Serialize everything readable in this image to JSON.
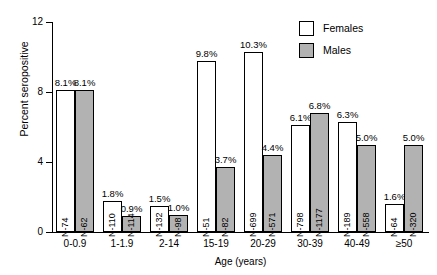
{
  "chart_data": {
    "type": "bar",
    "title": "",
    "xlabel": "Age (years)",
    "ylabel": "Percent seropositive",
    "ylim": [
      0,
      12
    ],
    "yticks": [
      0,
      4,
      8,
      12
    ],
    "ytick_labels": [
      "0",
      "4",
      "8",
      "12"
    ],
    "grid": false,
    "legend_position": "top-right",
    "categories": [
      "0-0.9",
      "1-1.9",
      "2-14",
      "15-19",
      "20-29",
      "30-39",
      "40-49",
      "≥50"
    ],
    "series": [
      {
        "name": "Females",
        "color": "#ffffff",
        "values": [
          8.1,
          1.8,
          1.5,
          9.8,
          10.3,
          6.1,
          6.3,
          1.6
        ],
        "value_labels": [
          "8.1%",
          "1.8%",
          "1.5%",
          "9.8%",
          "10.3%",
          "6.1%",
          "6.3%",
          "1.6%"
        ],
        "n_labels": [
          "N-74",
          "N-110",
          "N-132",
          "N-51",
          "N-699",
          "N-798",
          "N-189",
          "N-64"
        ]
      },
      {
        "name": "Males",
        "color": "#b2b2b2",
        "values": [
          8.1,
          0.9,
          1.0,
          3.7,
          4.4,
          6.8,
          5.0,
          5.0
        ],
        "value_labels": [
          "8.1%",
          "0.9%",
          "1.0%",
          "3.7%",
          "4.4%",
          "6.8%",
          "5.0%",
          "5.0%"
        ],
        "n_labels": [
          "N-62",
          "N-114",
          "N-98",
          "N-82",
          "N-571",
          "N-1177",
          "N-558",
          "N-320"
        ]
      }
    ]
  },
  "legend": {
    "items": [
      {
        "label": "Females",
        "swatch": "female"
      },
      {
        "label": "Males",
        "swatch": "male"
      }
    ]
  }
}
